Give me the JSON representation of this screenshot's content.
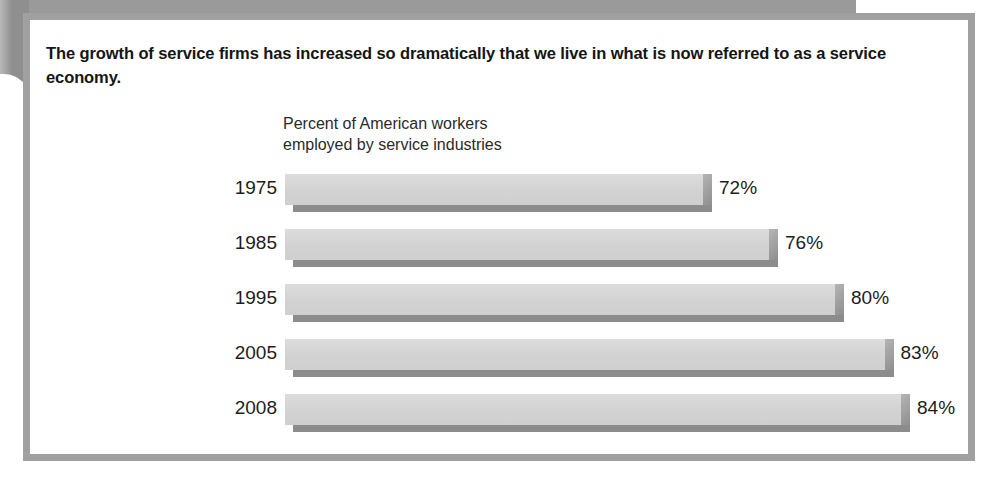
{
  "figure": {
    "title": "The growth of service firms has increased so dramatically that we live in what is now referred to as a service economy.",
    "subtitle_line1": "Percent of American workers",
    "subtitle_line2": "employed by service industries",
    "frame_color": "#a0a0a0",
    "bar_face_color": "#d4d4d4",
    "bar_shadow_color": "#8c8c8c",
    "ghost_mark_1": "",
    "ghost_mark_2": ""
  },
  "chart_data": {
    "type": "bar",
    "orientation": "horizontal",
    "title": "Percent of American workers employed by service industries",
    "xlabel": "",
    "ylabel": "",
    "xlim": [
      0,
      100
    ],
    "grid": false,
    "legend": null,
    "categories": [
      "1975",
      "1985",
      "1995",
      "2005",
      "2008"
    ],
    "values": [
      72,
      76,
      80,
      83,
      84
    ],
    "value_labels": [
      "72%",
      "76%",
      "80%",
      "83%",
      "84%"
    ],
    "bars": [
      {
        "category": "1975",
        "value": 72,
        "label": "72%"
      },
      {
        "category": "1985",
        "value": 76,
        "label": "76%"
      },
      {
        "category": "1995",
        "value": 80,
        "label": "80%"
      },
      {
        "category": "2005",
        "value": 83,
        "label": "83%"
      },
      {
        "category": "2008",
        "value": 84,
        "label": "84%"
      }
    ]
  }
}
